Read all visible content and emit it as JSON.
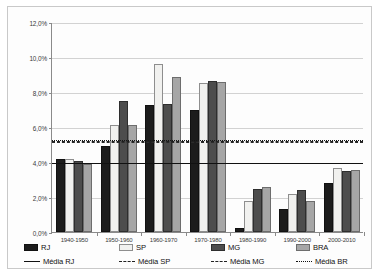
{
  "chart_data": {
    "type": "bar",
    "title": "",
    "xlabel": "",
    "ylabel": "",
    "ylim": [
      0,
      12
    ],
    "ytick_labels": [
      "12,0%",
      "10,0%",
      "8,0%",
      "6,0%",
      "4,0%",
      "2,0%",
      "0,0%"
    ],
    "ytick_values": [
      12,
      10,
      8,
      6,
      4,
      2,
      0
    ],
    "grid": true,
    "legend_position": "bottom",
    "categories": [
      "1940-1950",
      "1950-1960",
      "1960-1970",
      "1970-1980",
      "1980-1990",
      "1990-2000",
      "2000-2010"
    ],
    "series": [
      {
        "name": "RJ",
        "color": "#1c1c1c",
        "values": [
          4.15,
          4.9,
          7.25,
          7.0,
          0.25,
          1.3,
          2.8
        ]
      },
      {
        "name": "SP",
        "color": "#f1f1ef",
        "values": [
          4.15,
          6.1,
          9.6,
          8.5,
          1.75,
          2.2,
          3.65
        ]
      },
      {
        "name": "MG",
        "color": "#4d4d4d",
        "values": [
          4.05,
          7.5,
          7.3,
          8.65,
          2.45,
          2.4,
          3.5
        ]
      },
      {
        "name": "BRA",
        "color": "#a6a6a6",
        "values": [
          3.9,
          6.1,
          8.85,
          8.55,
          2.6,
          1.75,
          3.55
        ]
      }
    ],
    "reference_lines": [
      {
        "name": "Média RJ",
        "value": 4.0,
        "style": "solid",
        "color": "#111111"
      },
      {
        "name": "Média SP",
        "value": 5.2,
        "style": "dashed",
        "color": "#2b2b2b"
      },
      {
        "name": "Média MG",
        "value": 5.25,
        "style": "dashdot",
        "color": "#1f1f1f"
      },
      {
        "name": "Média BR",
        "value": 5.3,
        "style": "dotted",
        "color": "#151515"
      }
    ]
  },
  "legend": {
    "row1": [
      {
        "label": "RJ",
        "kind": "swatch",
        "key": "rj"
      },
      {
        "label": "SP",
        "kind": "swatch",
        "key": "sp"
      },
      {
        "label": "MG",
        "kind": "swatch",
        "key": "mg"
      },
      {
        "label": "BRA",
        "kind": "swatch",
        "key": "bra"
      }
    ],
    "row2": [
      {
        "label": "Média RJ",
        "kind": "line",
        "key": "solid"
      },
      {
        "label": "Média SP",
        "kind": "line",
        "key": "dashed"
      },
      {
        "label": "Média MG",
        "kind": "line",
        "key": "dashdot"
      },
      {
        "label": "Média BR",
        "kind": "line",
        "key": "dotted"
      }
    ]
  }
}
